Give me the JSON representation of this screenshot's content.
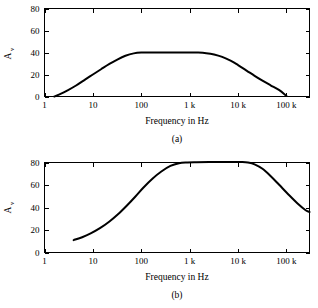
{
  "figure": {
    "name": "frequency-response-figure",
    "background": "#ffffff",
    "ink": "#000000"
  },
  "chart_data": [
    {
      "type": "line",
      "panel": "a",
      "caption": "(a)",
      "title": "",
      "xlabel": "Frequency in Hz",
      "ylabel": "A",
      "ylabel_sub": "v",
      "xscale": "log",
      "xlim": [
        1,
        300000
      ],
      "ylim": [
        0,
        80
      ],
      "xticks": [
        1,
        10,
        100,
        1000,
        10000,
        100000
      ],
      "xticklabels": [
        "1",
        "10",
        "100",
        "1 k",
        "10 k",
        "100 k"
      ],
      "yticks": [
        0,
        20,
        40,
        60,
        80
      ],
      "yticklabels": [
        "0",
        "20",
        "40",
        "60",
        "80"
      ],
      "grid": false,
      "legend": "none",
      "ticks_all_sides": true,
      "series": [
        {
          "name": "voltage-gain-a",
          "x": [
            1.6,
            2.2,
            3,
            4.5,
            7,
            10,
            15,
            22,
            32,
            47,
            70,
            100,
            200,
            500,
            1000,
            1500,
            2200,
            3200,
            4700,
            7000,
            10000,
            15000,
            22000,
            32000,
            47000,
            70000,
            100000
          ],
          "y": [
            0,
            2.6,
            5.6,
            10,
            15.6,
            20,
            25,
            29.6,
            33.6,
            37,
            39.2,
            39.9,
            40,
            40,
            40,
            39.9,
            39.4,
            38.2,
            36,
            32.6,
            28.6,
            23.6,
            18.8,
            14.4,
            10.2,
            6,
            0.6
          ]
        }
      ]
    },
    {
      "type": "line",
      "panel": "b",
      "caption": "(b)",
      "title": "",
      "xlabel": "Frequency in Hz",
      "ylabel": "A",
      "ylabel_sub": "v",
      "xscale": "log",
      "xlim": [
        1,
        300000
      ],
      "ylim": [
        0,
        80
      ],
      "xticks": [
        1,
        10,
        100,
        1000,
        10000,
        100000
      ],
      "xticklabels": [
        "1",
        "10",
        "100",
        "1 k",
        "10 k",
        "100 k"
      ],
      "yticks": [
        0,
        20,
        40,
        60,
        80
      ],
      "yticklabels": [
        "0",
        "20",
        "40",
        "60",
        "80"
      ],
      "grid": false,
      "legend": "none",
      "ticks_all_sides": true,
      "series": [
        {
          "name": "voltage-gain-b",
          "x": [
            4,
            6,
            9,
            14,
            22,
            33,
            50,
            75,
            110,
            170,
            260,
            400,
            600,
            900,
            1400,
            3000,
            7000,
            12000,
            16000,
            22000,
            32000,
            47000,
            70000,
            110000,
            170000,
            250000,
            300000
          ],
          "y": [
            11,
            13.6,
            17,
            21.6,
            27.6,
            34,
            41.6,
            49.6,
            57.6,
            65.6,
            72,
            77,
            79.4,
            80,
            80.2,
            80.4,
            80.4,
            80.4,
            80,
            78.4,
            74.4,
            68,
            60.4,
            51.6,
            43.6,
            37.6,
            36
          ]
        }
      ]
    }
  ],
  "labels": {
    "xaxis_title": "Frequency in Hz",
    "yaxis_symbol": "A",
    "yaxis_subscript": "v",
    "caption_a": "(a)",
    "caption_b": "(b)"
  }
}
